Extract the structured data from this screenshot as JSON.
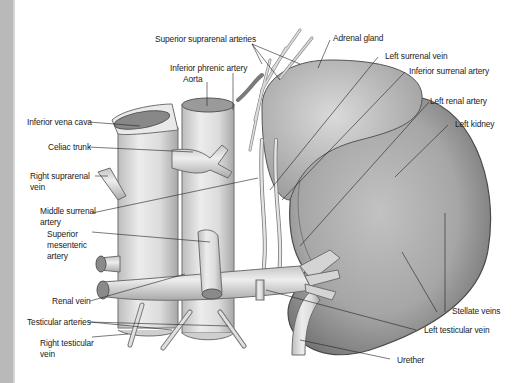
{
  "figure": {
    "labels": {
      "superior_suprarenal_arteries": "Superior suprarenal arteries",
      "adrenal_gland": "Adrenal gland",
      "left_surrenal_vein": "Left surrenal vein",
      "inferior_phrenic_artery": "Inferior phrenic artery",
      "inferior_surrenal_artery": "Inferior surrenal artery",
      "aorta": "Aorta",
      "left_renal_artery": "Left renal artery",
      "inferior_vena_cava": "Inferior vena cava",
      "left_kidney": "Left kidney",
      "celiac_trunk": "Celiac trunk",
      "right_suprarenal_vein_1": "Right suprarenal",
      "right_suprarenal_vein_2": "vein",
      "middle_surrenal_artery_1": "Middle surrenal",
      "middle_surrenal_artery_2": "artery",
      "superior_mesenteric_artery_1": "Superior",
      "superior_mesenteric_artery_2": "mesenteric",
      "superior_mesenteric_artery_3": "artery",
      "renal_vein": "Renal vein",
      "stellate_veins": "Stellate veins",
      "testicular_arteries": "Testicular arteries",
      "left_testicular_vein": "Left testicular vein",
      "right_testicular_vein_1": "Right testicular",
      "right_testicular_vein_2": "vein",
      "urether": "Urether"
    },
    "colors": {
      "background": "#ffffff",
      "edge_strip": "#b9b9b9",
      "vessel_fill": "#e2e2e2",
      "vessel_stroke": "#6e6e6e",
      "kidney_fill": "#a9a9a9",
      "adrenal_fill": "#c9c9c9",
      "leader_line": "#222222",
      "text": "#222222"
    }
  }
}
